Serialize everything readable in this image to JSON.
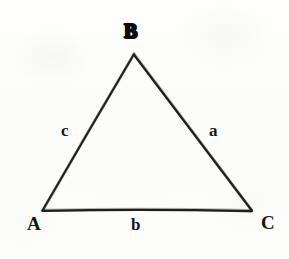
{
  "figure": {
    "kind": "geometry-diagram",
    "shape": "triangle",
    "background_color": "#fdfdfc",
    "ink_color": "#161616",
    "stroke_width_px": 2
  },
  "vertices": [
    {
      "id": "A",
      "label": "A",
      "position": "bottom-left",
      "x": 42,
      "y": 211
    },
    {
      "id": "B",
      "label": "B",
      "position": "apex",
      "x": 134,
      "y": 54
    },
    {
      "id": "C",
      "label": "C",
      "position": "bottom-right",
      "x": 252,
      "y": 211
    }
  ],
  "sides": [
    {
      "id": "a",
      "label": "a",
      "between": "B-C",
      "position": "right"
    },
    {
      "id": "b",
      "label": "b",
      "between": "A-C",
      "position": "bottom"
    },
    {
      "id": "c",
      "label": "c",
      "between": "A-B",
      "position": "left"
    }
  ],
  "labels": {
    "vertex_a": "A",
    "vertex_b": "B",
    "vertex_c": "C",
    "side_a": "a",
    "side_b": "b",
    "side_c": "c"
  }
}
